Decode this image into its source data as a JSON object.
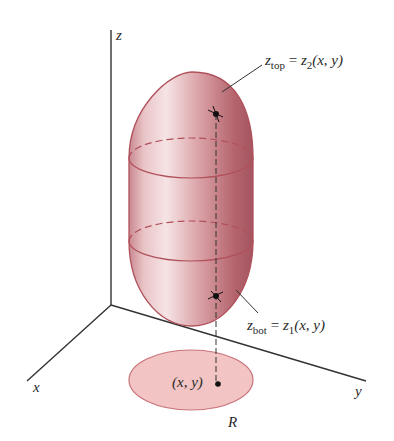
{
  "diagram": {
    "axes": {
      "x_label": "x",
      "y_label": "y",
      "z_label": "z"
    },
    "annotations": {
      "top": {
        "lhs": "z",
        "lhs_sub": "top",
        "eq": " = ",
        "rhs": "z",
        "rhs_sub": "2",
        "args": "(x, y)"
      },
      "bottom": {
        "lhs": "z",
        "lhs_sub": "bot",
        "eq": " = ",
        "rhs": "z",
        "rhs_sub": "1",
        "args": "(x, y)"
      },
      "point": "(x, y)",
      "region": "R"
    },
    "colors": {
      "solid_fill": "#d9a3a8",
      "solid_edge": "#b0505a",
      "region_fill": "#f2c4c4",
      "region_edge": "#c8737a",
      "axis": "#333333"
    }
  }
}
